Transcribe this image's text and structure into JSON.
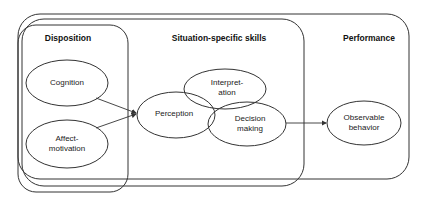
{
  "diagram": {
    "groups": [
      {
        "id": "disposition",
        "title": "Disposition"
      },
      {
        "id": "situation",
        "title": "Situation-specific skills"
      },
      {
        "id": "performance",
        "title": "Performance"
      }
    ],
    "nodes": {
      "cognition": {
        "line1": "Cognition",
        "line2": ""
      },
      "affect": {
        "line1": "Affect-",
        "line2": "motivation"
      },
      "perception": {
        "line1": "Perception",
        "line2": ""
      },
      "interpretation": {
        "line1": "Interpret-",
        "line2": "ation"
      },
      "decision": {
        "line1": "Decision",
        "line2": "making"
      },
      "observable": {
        "line1": "Observable",
        "line2": "behavior"
      }
    },
    "edges": [
      {
        "from": "cognition",
        "to": "perception"
      },
      {
        "from": "affect-motivation",
        "to": "perception"
      },
      {
        "from": "decision-making",
        "to": "observable-behavior"
      }
    ],
    "colors": {
      "stroke": "#333333",
      "background": "#ffffff"
    }
  }
}
